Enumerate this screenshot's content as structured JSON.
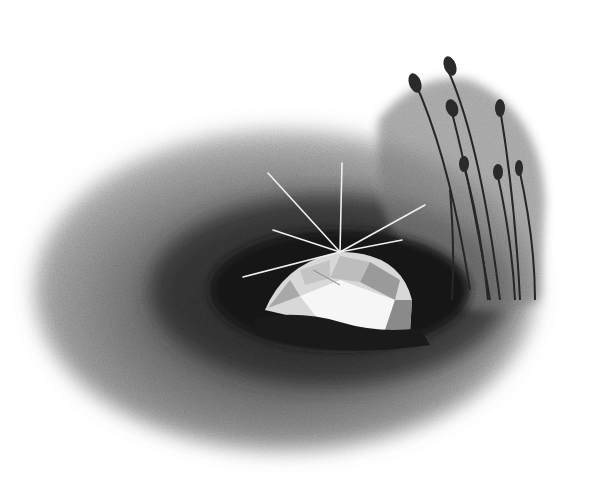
{
  "scene": {
    "description": "Pencil/charcoal illustration of a faceted gem in a dark hollow with grass stalks",
    "background": "#ffffff",
    "colors": {
      "outer_shadow": "#9a9a9a",
      "mid_shadow": "#5a5a5a",
      "hole": "#161616",
      "gem_light": "#f2f2f2",
      "gem_mid": "#c8c8c8",
      "gem_dark": "#7a7a7a",
      "stalk": "#2a2a2a"
    }
  }
}
